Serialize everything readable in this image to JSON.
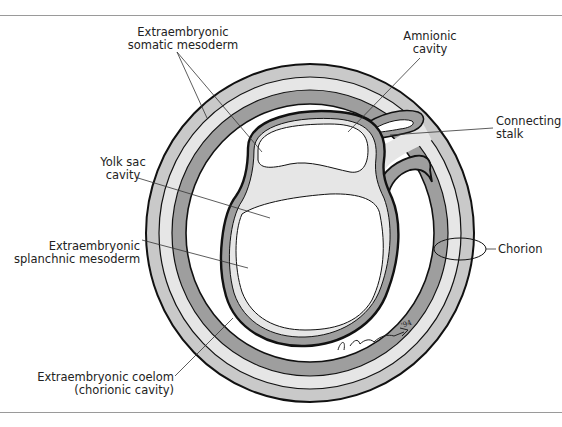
{
  "figure": {
    "type": "cross-section diagram of early embryo within chorionic sac",
    "labels": {
      "somatic_mesoderm": [
        "Extraembryonic",
        "somatic mesoderm"
      ],
      "amnionic_cavity": [
        "Amnionic",
        "cavity"
      ],
      "connecting_stalk": [
        "Connecting",
        "stalk"
      ],
      "yolk_sac_cavity": [
        "Yolk sac",
        "cavity"
      ],
      "chorion": [
        "Chorion"
      ],
      "splanchnic_mesoderm": [
        "Extraembryonic",
        "splanchnic mesoderm"
      ],
      "coelom": [
        "Extraembryonic coelom",
        "(chorionic cavity)"
      ]
    },
    "signature": "S. Cummings '94",
    "colors": {
      "outline": "#111111",
      "band_light": "#c9c9c9",
      "band_lighter": "#e6e6e6",
      "band_dark": "#9e9e9e",
      "rule": "#9a9a9a",
      "leader": "#333333"
    }
  }
}
